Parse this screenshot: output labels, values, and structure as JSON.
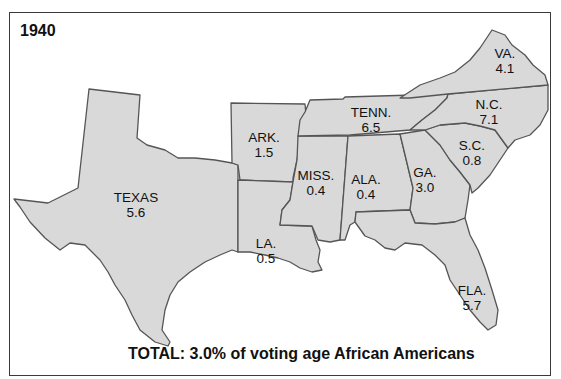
{
  "map": {
    "year": "1940",
    "total_caption": "TOTAL: 3.0% of voting age African Americans",
    "fill_color": "#d9d9d9",
    "border_color": "#555555",
    "states": [
      {
        "abbr": "TEXAS",
        "value": "5.6"
      },
      {
        "abbr": "ARK.",
        "value": "1.5"
      },
      {
        "abbr": "LA.",
        "value": "0.5"
      },
      {
        "abbr": "MISS.",
        "value": "0.4"
      },
      {
        "abbr": "ALA.",
        "value": "0.4"
      },
      {
        "abbr": "TENN.",
        "value": "6.5"
      },
      {
        "abbr": "GA.",
        "value": "3.0"
      },
      {
        "abbr": "S.C.",
        "value": "0.8"
      },
      {
        "abbr": "N.C.",
        "value": "7.1"
      },
      {
        "abbr": "VA.",
        "value": "4.1"
      },
      {
        "abbr": "FLA.",
        "value": "5.7"
      }
    ]
  }
}
